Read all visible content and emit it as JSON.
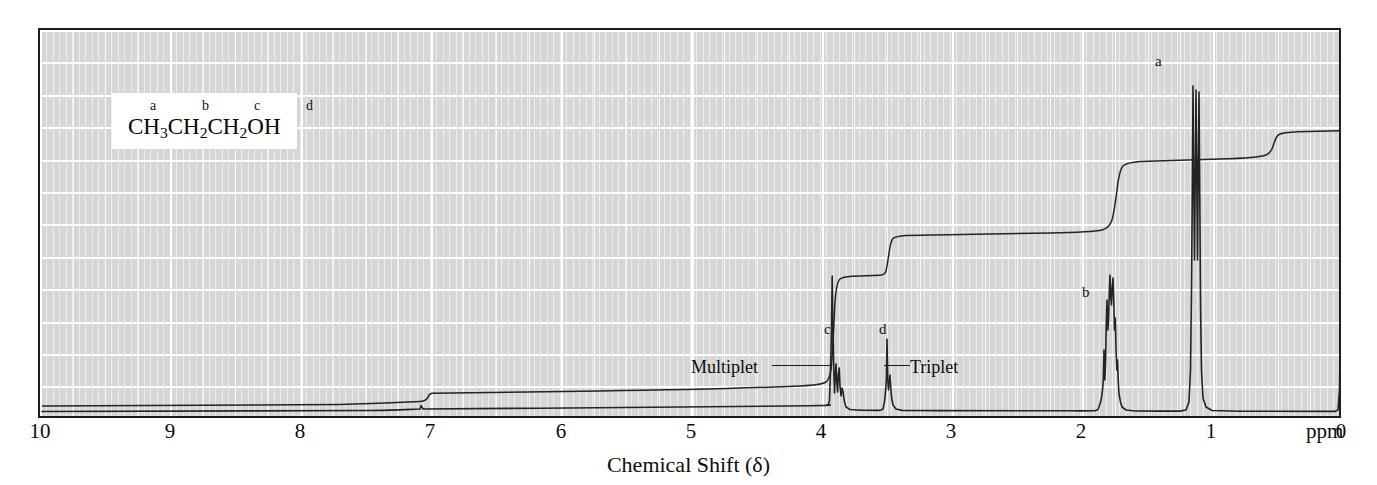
{
  "figure": {
    "title": "",
    "axis_title": "Chemical Shift (δ)",
    "unit_label": "ppm"
  },
  "structure": {
    "letters": "a      b      c      d",
    "letter_list": [
      "a",
      "b",
      "c",
      "d"
    ],
    "formula_parts": [
      {
        "text": "CH",
        "sub": "3"
      },
      {
        "text": "CH",
        "sub": "2"
      },
      {
        "text": "CH",
        "sub": "2"
      },
      {
        "text": "OH",
        "sub": ""
      }
    ],
    "formula_plain": "CH3CH2CH2OH",
    "compound": "1-propanol"
  },
  "peak_labels": [
    {
      "id": "a",
      "text": "a",
      "shift": 0.93,
      "x_px": 1155,
      "y_px": 54
    },
    {
      "id": "b",
      "text": "b",
      "shift": 1.58,
      "x_px": 1082,
      "y_px": 285
    },
    {
      "id": "c",
      "text": "c",
      "shift": 3.58,
      "x_px": 824,
      "y_px": 322
    },
    {
      "id": "d",
      "text": "d",
      "shift": 3.18,
      "x_px": 879,
      "y_px": 322
    }
  ],
  "annotations": [
    {
      "id": "multiplet",
      "text": "Multiplet",
      "x_px": 691,
      "y_px": 358,
      "leader_x": 772,
      "leader_width": 58,
      "leader_y": 365
    },
    {
      "id": "triplet",
      "text": "Triplet",
      "x_px": 910,
      "y_px": 358,
      "leader_x": 884,
      "leader_width": 26,
      "leader_y": 365
    }
  ],
  "axis": {
    "ticks": [
      {
        "value": "10",
        "x_px": 40
      },
      {
        "value": "9",
        "x_px": 170
      },
      {
        "value": "8",
        "x_px": 300
      },
      {
        "value": "7",
        "x_px": 430
      },
      {
        "value": "6",
        "x_px": 561
      },
      {
        "value": "5",
        "x_px": 691
      },
      {
        "value": "4",
        "x_px": 821
      },
      {
        "value": "3",
        "x_px": 951
      },
      {
        "value": "2",
        "x_px": 1081
      },
      {
        "value": "1",
        "x_px": 1211
      },
      {
        "value": "0",
        "x_px": 1341
      }
    ],
    "range": [
      10,
      0
    ],
    "direction": "right-to-left"
  },
  "colors": {
    "plot_background": "#d6d6d6",
    "grid_major": "#ffffff",
    "trace": "#232323",
    "frame": "#1d1d1d",
    "text": "#0c0c0c",
    "caption_background": "#ffffff"
  },
  "chart_data": {
    "type": "line",
    "xlabel": "Chemical Shift (δ)",
    "ylabel": "",
    "xlim": [
      10,
      0
    ],
    "grid": true,
    "legend": "none",
    "series": [
      {
        "name": "NMR trace",
        "peaks": [
          {
            "label": "a",
            "assignment": "CH3",
            "shift_ppm": 0.93,
            "multiplicity": "triplet",
            "relative_height": 0.9,
            "protons": 3
          },
          {
            "label": "b",
            "assignment": "CH2 (middle)",
            "shift_ppm": 1.58,
            "multiplicity": "sextet",
            "relative_height": 0.32,
            "protons": 2
          },
          {
            "label": "c",
            "assignment": "CH2-O",
            "shift_ppm": 3.58,
            "multiplicity": "multiplet",
            "relative_height": 0.22,
            "protons": 2
          },
          {
            "label": "d",
            "assignment": "OH",
            "shift_ppm": 3.18,
            "multiplicity": "triplet",
            "relative_height": 0.14,
            "protons": 1
          },
          {
            "label": "TMS",
            "assignment": "tetramethylsilane reference",
            "shift_ppm": 0.0,
            "multiplicity": "singlet",
            "relative_height": 0.3,
            "protons": 0
          },
          {
            "label": "solvent",
            "assignment": "residual CHCl3",
            "shift_ppm": 7.27,
            "multiplicity": "singlet",
            "relative_height": 0.01,
            "protons": 0
          }
        ]
      },
      {
        "name": "Integration curve",
        "steps": [
          {
            "shift_ppm": 7.27,
            "step_height": 0.01
          },
          {
            "shift_ppm": 3.58,
            "step_height": 0.2
          },
          {
            "shift_ppm": 3.18,
            "step_height": 0.1
          },
          {
            "shift_ppm": 1.58,
            "step_height": 0.2
          },
          {
            "shift_ppm": 0.93,
            "step_height": 0.3
          },
          {
            "shift_ppm": 0.0,
            "step_height": 0.03
          }
        ]
      }
    ]
  }
}
